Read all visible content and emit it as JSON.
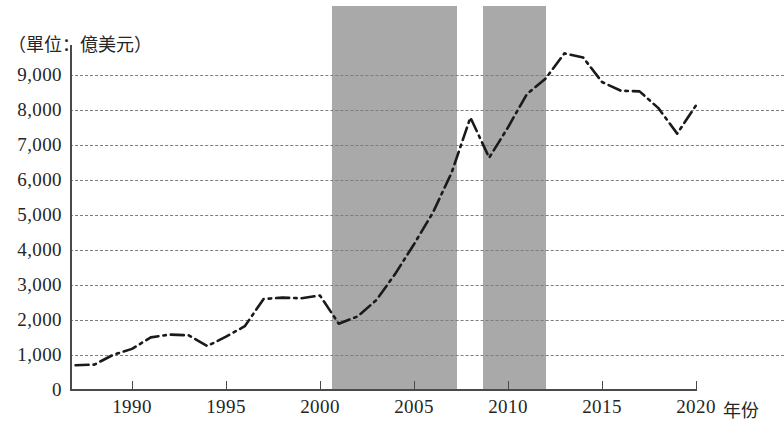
{
  "chart_data": {
    "type": "line",
    "title": "",
    "unit_note": "（單位：億美元）",
    "xlabel": "年份",
    "ylabel": "",
    "xlim": [
      1987,
      2020
    ],
    "ylim": [
      0,
      9500
    ],
    "grid": true,
    "legend": false,
    "y_ticks": [
      "9,000",
      "8,000",
      "7,000",
      "6,000",
      "5,000",
      "4,000",
      "3,000",
      "2,000",
      "1,000",
      "0"
    ],
    "y_tick_values": [
      9000,
      8000,
      7000,
      6000,
      5000,
      4000,
      3000,
      2000,
      1000,
      0
    ],
    "x_ticks": [
      "1990",
      "1995",
      "2000",
      "2005",
      "2010",
      "2015",
      "2020"
    ],
    "x_tick_values": [
      1990,
      1995,
      2000,
      2005,
      2010,
      2015,
      2020
    ],
    "line_color": "#1a1a1a",
    "line_style": "dash-dot",
    "band_color": "#a9a9a9",
    "shaded_bands": [
      {
        "start": 2001,
        "end": 2008
      },
      {
        "start": 2009.5,
        "end": 2013
      },
      {
        "label": ""
      }
    ],
    "x": [
      1987,
      1988,
      1989,
      1990,
      1991,
      1992,
      1993,
      1994,
      1995,
      1996,
      1997,
      1998,
      1999,
      2000,
      2001,
      2002,
      2003,
      2004,
      2005,
      2006,
      2007,
      2008,
      2009,
      2010,
      2011,
      2012,
      2013,
      2014,
      2015,
      2016,
      2017,
      2018,
      2019,
      2020
    ],
    "values": [
      680,
      700,
      980,
      1150,
      1480,
      1560,
      1540,
      1230,
      1500,
      1800,
      2580,
      2620,
      2600,
      2680,
      1870,
      2080,
      2550,
      3300,
      4150,
      5050,
      6200,
      7780,
      6630,
      7500,
      8450,
      8900,
      9620,
      9500,
      8800,
      8550,
      8530,
      8050,
      7320,
      8130
    ],
    "series": [
      {
        "name": "外商直接投資",
        "values": [
          680,
          700,
          980,
          1150,
          1480,
          1560,
          1540,
          1230,
          1500,
          1800,
          2580,
          2620,
          2600,
          2680,
          1870,
          2080,
          2550,
          3300,
          4150,
          5050,
          6200,
          7780,
          6630,
          7500,
          8450,
          8900,
          9620,
          9500,
          8800,
          8550,
          8530,
          8050,
          7320,
          8130
        ]
      }
    ]
  }
}
